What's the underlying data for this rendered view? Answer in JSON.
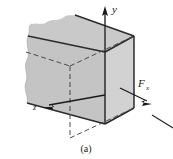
{
  "figure": {
    "caption": "(a)",
    "labels": {
      "y_axis": "y",
      "z_axis": "z",
      "force_x_main": "F",
      "force_x_sub": "x"
    },
    "colors": {
      "top_face": "#c9c9c9",
      "left_face": "#c4c4c4",
      "right_face": "#d2d2d2",
      "edge_line": "#2b2b2b",
      "hidden_line": "#4a4a4a",
      "background": "#ffffff",
      "text": "#1a1a1a"
    },
    "geometry": {
      "front_top": [
        105,
        52
      ],
      "front_bottom": [
        105,
        124
      ],
      "top_left": [
        36,
        30
      ],
      "top_back": [
        70,
        14
      ],
      "right_top_back": [
        134,
        36
      ],
      "right_bottom_back": [
        134,
        108
      ],
      "left_bottom": [
        36,
        102
      ],
      "bottom_back_right": [
        70,
        138
      ]
    },
    "annotations": {
      "y_arrow_tip": [
        105,
        7
      ],
      "z_arrow_tip": [
        44,
        107
      ],
      "fx_arrow_tip": [
        150,
        103
      ],
      "cut_line_present": true
    }
  }
}
